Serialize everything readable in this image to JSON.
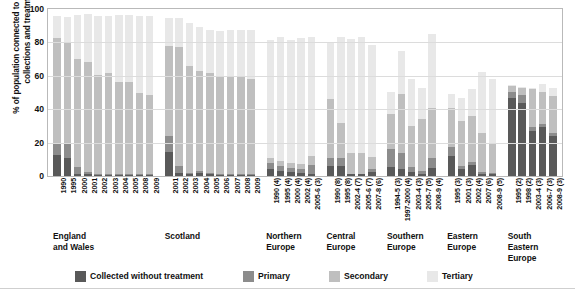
{
  "chart_data": {
    "type": "bar",
    "stacked": true,
    "title": "",
    "xlabel": "",
    "ylabel": "% of population connected to wastewater collections and treatment",
    "ylim": [
      0,
      100
    ],
    "yticks": [
      0,
      20,
      40,
      60,
      80,
      100
    ],
    "grid": true,
    "legend_position": "bottom",
    "series": [
      {
        "name": "Collected without treatment",
        "color": "#595959"
      },
      {
        "name": "Primary",
        "color": "#8c8c8c"
      },
      {
        "name": "Secondary",
        "color": "#bfbfbf"
      },
      {
        "name": "Tertiary",
        "color": "#e8e8e8"
      }
    ],
    "groups": [
      {
        "label": "England\nand Wales",
        "categories": [
          "1990",
          "1995",
          "2000",
          "2001",
          "2002",
          "2003",
          "2004",
          "2005",
          "2008",
          "2009"
        ],
        "values": {
          "Collected without treatment": [
            12.5,
            11.0,
            1.5,
            1.0,
            0.5,
            0.5,
            0.5,
            0.5,
            0.5,
            0.5
          ],
          "Primary": [
            7.5,
            8.5,
            4.0,
            1.5,
            0.5,
            0.5,
            0.5,
            0.5,
            0.5,
            0.5
          ],
          "Secondary": [
            62.5,
            61.0,
            64.5,
            66.0,
            59.5,
            60.5,
            55.5,
            55.5,
            48.5,
            47.5
          ],
          "Tertiary": [
            13.5,
            15.0,
            26.5,
            28.5,
            35.5,
            34.5,
            40.0,
            40.0,
            46.5,
            47.5
          ]
        }
      },
      {
        "label": "Scotland",
        "categories": [
          "2001",
          "2002",
          "2003",
          "2004",
          "2005",
          "2006",
          "2007",
          "2008",
          "2009"
        ],
        "values": {
          "Collected without treatment": [
            14.5,
            2.0,
            1.0,
            2.0,
            1.0,
            0.5,
            0.5,
            0.5,
            0.5
          ],
          "Primary": [
            9.5,
            4.0,
            1.0,
            1.0,
            1.0,
            0.5,
            0.5,
            0.5,
            0.5
          ],
          "Secondary": [
            54.0,
            71.5,
            64.0,
            60.0,
            60.0,
            58.0,
            58.0,
            58.0,
            57.0
          ],
          "Tertiary": [
            16.5,
            17.0,
            25.5,
            26.0,
            25.5,
            28.0,
            28.5,
            28.5,
            29.5
          ]
        }
      },
      {
        "label": "Northern\nEurope",
        "categories": [
          "1990 (4)",
          "1995 (4)",
          "2000 (4)",
          "2002 (4)",
          "2005-6 (3)"
        ],
        "values": {
          "Collected without treatment": [
            4.0,
            3.0,
            2.5,
            2.0,
            1.5
          ],
          "Primary": [
            3.5,
            3.0,
            2.5,
            2.5,
            5.0
          ],
          "Secondary": [
            3.0,
            3.0,
            2.5,
            2.5,
            5.5
          ],
          "Tertiary": [
            71.0,
            74.0,
            74.0,
            75.5,
            71.5
          ]
        }
      },
      {
        "label": "Central\nEurope",
        "categories": [
          "1990 (8)",
          "1995 (8)",
          "2002-4 (7)",
          "2005-6 (7)",
          "2007-8 (6)"
        ],
        "values": {
          "Collected without treatment": [
            6.0,
            6.0,
            1.0,
            1.0,
            2.5
          ],
          "Primary": [
            5.0,
            4.5,
            0.5,
            0.5,
            1.5
          ],
          "Secondary": [
            35.0,
            21.5,
            12.0,
            12.0,
            7.5
          ],
          "Tertiary": [
            33.5,
            51.0,
            68.5,
            69.5,
            67.0
          ]
        }
      },
      {
        "label": "Southern\nEurope",
        "categories": [
          "1994-5 (3)",
          "1997-2000 (4)",
          "2003-4 (3)",
          "2005-7 (5)",
          "2008-9 (4)"
        ],
        "values": {
          "Collected without treatment": [
            5.5,
            4.0,
            2.5,
            1.5,
            5.0
          ],
          "Primary": [
            10.5,
            9.5,
            3.0,
            1.5,
            5.5
          ],
          "Secondary": [
            21.0,
            35.5,
            24.5,
            31.0,
            30.0
          ],
          "Tertiary": [
            13.5,
            26.0,
            28.0,
            19.0,
            44.5
          ]
        }
      },
      {
        "label": "Eastern\nEurope",
        "categories": [
          "1995 (3)",
          "2001 (3)",
          "2002 (4)",
          "2007 (6)",
          "2008-9 (5)"
        ],
        "values": {
          "Collected without treatment": [
            12.0,
            4.5,
            6.5,
            1.5,
            1.5
          ],
          "Primary": [
            5.5,
            1.5,
            2.0,
            1.0,
            0.5
          ],
          "Secondary": [
            23.5,
            27.0,
            27.5,
            23.0,
            18.0
          ],
          "Tertiary": [
            8.0,
            14.0,
            16.0,
            36.5,
            38.0
          ]
        }
      },
      {
        "label": "South\nEastern\nEurope",
        "categories": [
          "1995 (2)",
          "1998 (2)",
          "2003-4 (3)",
          "2006-7 (3)",
          "2008-9 (3)"
        ],
        "values": {
          "Collected without treatment": [
            46.5,
            44.0,
            27.0,
            29.5,
            24.0
          ],
          "Primary": [
            4.0,
            4.5,
            2.5,
            1.5,
            1.5
          ],
          "Secondary": [
            3.5,
            4.5,
            22.5,
            19.5,
            22.5
          ],
          "Tertiary": [
            0.5,
            0.5,
            1.0,
            4.5,
            4.5
          ]
        }
      }
    ]
  }
}
